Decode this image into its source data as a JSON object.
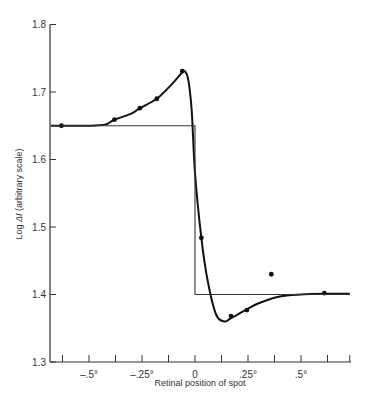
{
  "chart_data": {
    "type": "line",
    "title": "",
    "xlabel": "Retinal position of spot",
    "ylabel": "Log ΔI (arbitrary scale)",
    "xlim": [
      -0.68,
      0.73
    ],
    "ylim": [
      1.3,
      1.8
    ],
    "grid": false,
    "legend": null,
    "x_ticks": [
      {
        "value": -0.5,
        "label": "–.5°"
      },
      {
        "value": -0.25,
        "label": "–.25°"
      },
      {
        "value": 0,
        "label": "0"
      },
      {
        "value": 0.25,
        "label": ".25°"
      },
      {
        "value": 0.5,
        "label": ".5°"
      }
    ],
    "x_minor_ticks": [
      -0.625,
      -0.5,
      -0.375,
      -0.25,
      -0.125,
      0,
      0.125,
      0.25,
      0.375,
      0.5,
      0.625,
      0.73
    ],
    "y_ticks": [
      {
        "value": 1.3,
        "label": "1.3"
      },
      {
        "value": 1.4,
        "label": "1.4"
      },
      {
        "value": 1.5,
        "label": "1.5"
      },
      {
        "value": 1.6,
        "label": "1.6"
      },
      {
        "value": 1.7,
        "label": "1.7"
      },
      {
        "value": 1.8,
        "label": "1.8"
      }
    ],
    "series": [
      {
        "name": "measured points",
        "kind": "scatter",
        "x": [
          -0.63,
          -0.38,
          -0.26,
          -0.18,
          -0.06,
          0.03,
          0.17,
          0.245,
          0.36,
          0.61
        ],
        "y": [
          1.65,
          1.659,
          1.676,
          1.69,
          1.731,
          1.484,
          1.368,
          1.377,
          1.43,
          1.402
        ]
      },
      {
        "name": "smooth fitted curve",
        "kind": "line",
        "x": [
          -0.68,
          -0.63,
          -0.5,
          -0.42,
          -0.38,
          -0.3,
          -0.26,
          -0.18,
          -0.12,
          -0.08,
          -0.06,
          -0.045,
          -0.03,
          -0.015,
          0.0,
          0.03,
          0.06,
          0.1,
          0.14,
          0.17,
          0.245,
          0.3,
          0.4,
          0.5,
          0.61,
          0.73
        ],
        "y": [
          1.65,
          1.65,
          1.65,
          1.652,
          1.659,
          1.668,
          1.676,
          1.69,
          1.708,
          1.722,
          1.729,
          1.73,
          1.715,
          1.67,
          1.58,
          1.484,
          1.42,
          1.37,
          1.36,
          1.365,
          1.378,
          1.387,
          1.397,
          1.4,
          1.401,
          1.401
        ]
      },
      {
        "name": "step function",
        "kind": "line",
        "x": [
          -0.68,
          0.0,
          0.0,
          0.73
        ],
        "y": [
          1.65,
          1.65,
          1.4,
          1.4
        ]
      }
    ]
  },
  "labels": {
    "xlabel": "Retinal position of spot",
    "ylabel_prefix": "Log ",
    "ylabel_symbol": "ΔI",
    "ylabel_suffix": " (arbitrary scale)"
  }
}
